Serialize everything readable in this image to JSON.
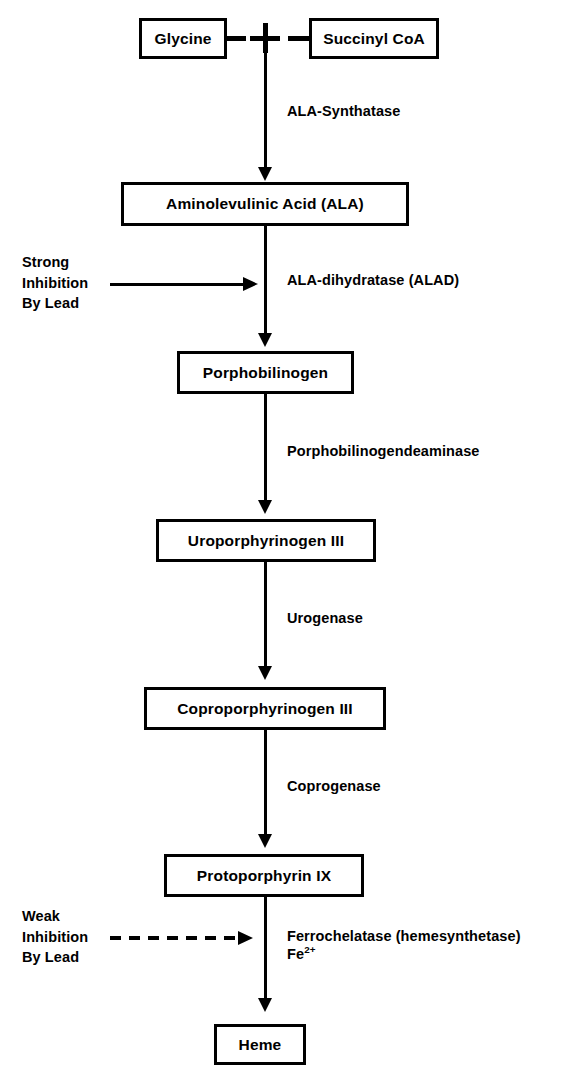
{
  "diagram": {
    "ink_color": "#000000",
    "background_color": "#ffffff"
  },
  "nodes": [
    {
      "id": "glycine",
      "label": "Glycine"
    },
    {
      "id": "succinyl-coa",
      "label": "Succinyl CoA"
    },
    {
      "id": "ala",
      "label": "Aminolevulinic Acid (ALA)"
    },
    {
      "id": "porphobilinogen",
      "label": "Porphobilinogen"
    },
    {
      "id": "uroporphyrinogen",
      "label": "Uroporphyrinogen III"
    },
    {
      "id": "coproporphyrinogen",
      "label": "Coproporphyrinogen III"
    },
    {
      "id": "protoporphyrin",
      "label": "Protoporphyrin IX"
    },
    {
      "id": "heme",
      "label": "Heme"
    }
  ],
  "junction": {
    "operator": "+"
  },
  "enzymes": [
    {
      "id": "ala-synthatase",
      "label": "ALA-Synthatase"
    },
    {
      "id": "ala-dihydratase",
      "label": "ALA-dihydratase (ALAD)"
    },
    {
      "id": "pbg-deaminase",
      "label": "Porphobilinogendeaminase"
    },
    {
      "id": "urogenase",
      "label": "Urogenase"
    },
    {
      "id": "coprogenase",
      "label": "Coprogenase"
    },
    {
      "id": "ferrochelatase",
      "label": "Ferrochelatase (hemesynthetase)"
    }
  ],
  "cofactor": {
    "element": "Fe",
    "charge": "2+"
  },
  "inhibitions": [
    {
      "id": "strong-lead",
      "line1": "Strong",
      "line2": "Inhibition",
      "line3": "By Lead",
      "arrow_style": "solid",
      "target_step": "ALA-dihydratase (ALAD)"
    },
    {
      "id": "weak-lead",
      "line1": "Weak",
      "line2": "Inhibition",
      "line3": "By Lead",
      "arrow_style": "dashed",
      "target_step": "Ferrochelatase (hemesynthetase)"
    }
  ]
}
